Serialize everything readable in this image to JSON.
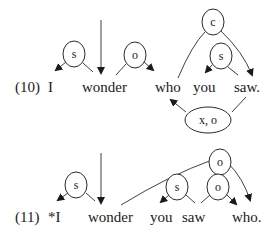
{
  "examples": [
    {
      "number": "(10)",
      "words": [
        "I",
        "wonder",
        "who",
        "you",
        "saw."
      ],
      "nodes": [
        "s",
        "o",
        "c",
        "s",
        "x, o"
      ],
      "grammatical": true
    },
    {
      "number": "(11)",
      "words": [
        "*I",
        "wonder",
        "you",
        "saw",
        "who."
      ],
      "nodes": [
        "s",
        "o",
        "s",
        "o"
      ],
      "grammatical": false
    }
  ],
  "colors": {
    "ink": "#1a1a1a",
    "background": "#ffffff"
  }
}
